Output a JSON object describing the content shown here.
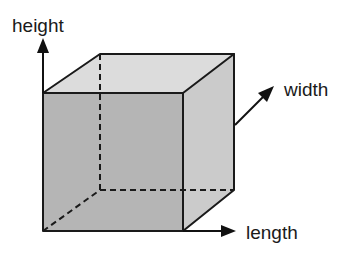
{
  "diagram": {
    "type": "cube-dimensions",
    "labels": {
      "height": "height",
      "width": "width",
      "length": "length"
    },
    "colors": {
      "front_face": "#b5b5b5",
      "side_face": "#cbcbcb",
      "top_face": "#dcdcdc",
      "edges": "#1a1a1a",
      "background": "#ffffff"
    },
    "edges": {
      "visible_style": "solid",
      "hidden_style": "dashed"
    },
    "axes": [
      {
        "name": "height",
        "direction": "up"
      },
      {
        "name": "width",
        "direction": "diagonal-up-right"
      },
      {
        "name": "length",
        "direction": "right"
      }
    ]
  }
}
